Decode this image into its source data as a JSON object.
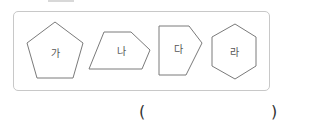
{
  "shapes": [
    {
      "id": "ga",
      "label": "가",
      "type": "pentagon"
    },
    {
      "id": "na",
      "label": "나",
      "type": "irregular-pentagon"
    },
    {
      "id": "da",
      "label": "다",
      "type": "irregular-pentagon"
    },
    {
      "id": "ra",
      "label": "라",
      "type": "hexagon"
    }
  ],
  "answer": {
    "open_paren": "(",
    "close_paren": ")",
    "value": ""
  },
  "colors": {
    "shape_stroke": "#7a7a7a",
    "box_border": "#c8c8c8"
  }
}
